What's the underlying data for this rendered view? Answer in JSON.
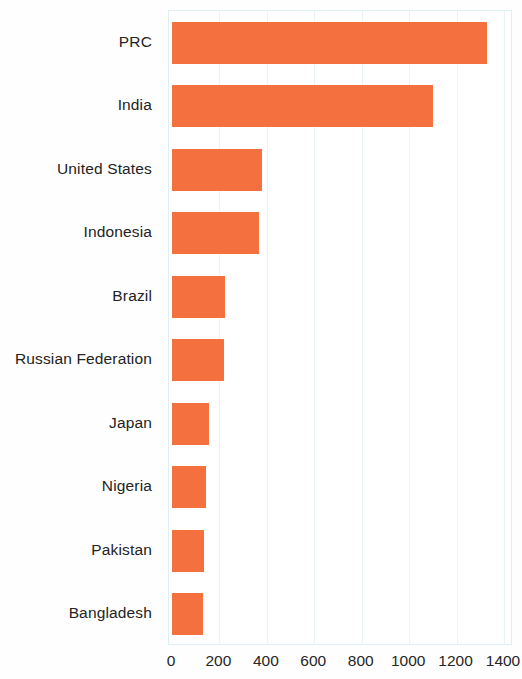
{
  "chart_data": {
    "type": "bar",
    "orientation": "horizontal",
    "title": "",
    "subtitle": "",
    "xlabel": "",
    "ylabel": "",
    "categories": [
      "PRC",
      "India",
      "United States",
      "Indonesia",
      "Brazil",
      "Russian Federation",
      "Japan",
      "Nigeria",
      "Pakistan",
      "Bangladesh"
    ],
    "values": [
      1330,
      1100,
      380,
      365,
      225,
      220,
      155,
      145,
      135,
      130
    ],
    "xlim": [
      0,
      1400
    ],
    "ylim": null,
    "xticks": [
      0,
      200,
      400,
      600,
      800,
      1000,
      1200,
      1400
    ],
    "xtick_labels": [
      "0",
      "200",
      "400",
      "600",
      "800",
      "1000",
      "1200",
      "1400"
    ],
    "grid": true,
    "grid_axis": "x",
    "legend": false,
    "legend_position": "none",
    "bar_color": "#f4703e",
    "grid_color": "#e9f4f6",
    "axis_border_color": "#dff0f2",
    "background_color": "#ffffff",
    "annotations": []
  }
}
